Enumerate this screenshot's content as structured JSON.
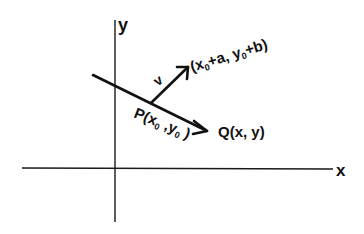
{
  "diagram": {
    "axes": {
      "x_label": "x",
      "y_label": "y"
    },
    "labels": {
      "vector": "v",
      "vector_tip": {
        "pre": "(x",
        "sub1": "0",
        "mid": "+a, y",
        "sub2": "0",
        "post": "+b)"
      },
      "point_p": {
        "pre": "P(x",
        "sub1": "0",
        "mid": " ,y",
        "sub2": "0",
        "post": " )"
      },
      "point_q": "Q(x, y)"
    },
    "colors": {
      "ink": "#111111",
      "background": "#ffffff"
    }
  }
}
